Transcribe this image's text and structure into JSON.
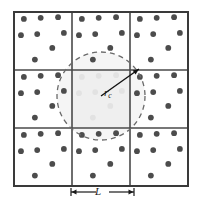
{
  "figure": {
    "name": "periodic-boundary-conditions-cutoff-diagram",
    "grid": {
      "rows": 3,
      "cols": 3,
      "x0": 14,
      "y0": 12,
      "cell": 58,
      "outer_stroke": "#3a3a3a",
      "outer_width": 2.0,
      "inner_stroke": "#4a4a4a",
      "inner_width": 1.6,
      "cell_fill": "#ffffff"
    },
    "center_cell": {
      "fill": "#f1f1f1",
      "row": 1,
      "col": 1
    },
    "particles": {
      "radius": 2.9,
      "color": "#4c4c4c",
      "faded_color": "#e2e2e2",
      "count_per_cell": 8,
      "unit_positions": [
        [
          0.17,
          0.12
        ],
        [
          0.46,
          0.1
        ],
        [
          0.76,
          0.09
        ],
        [
          0.86,
          0.36
        ],
        [
          0.12,
          0.4
        ],
        [
          0.4,
          0.38
        ],
        [
          0.66,
          0.62
        ],
        [
          0.36,
          0.82
        ]
      ]
    },
    "cutoff_circle": {
      "cx": 101,
      "cy": 96,
      "r": 44,
      "dash": "5,4",
      "stroke": "#6a6a6a",
      "stroke_width": 1.3,
      "fill": "#ededed",
      "fill_opacity": 0.55
    },
    "radius_arrow": {
      "x1": 101,
      "y1": 96,
      "x2": 139,
      "y2": 69,
      "stroke": "#111111",
      "stroke_width": 1.4
    },
    "scale_bar": {
      "x1": 71,
      "x2": 134,
      "y": 192,
      "stroke": "#1a1a1a",
      "stroke_width": 1.2,
      "tick_half_height": 4
    },
    "labels": {
      "cutoff_radius": "r",
      "cutoff_radius_subscript": "c",
      "box_length": "L"
    }
  }
}
